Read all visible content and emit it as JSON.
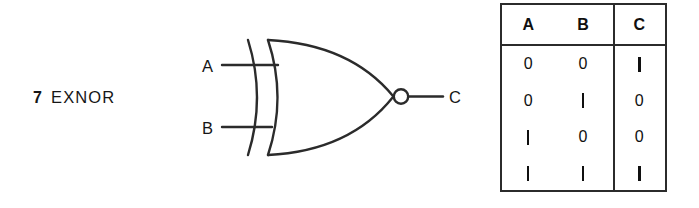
{
  "caption": {
    "index": "7",
    "name": "EXNOR"
  },
  "diagram": {
    "gate_type": "exnor-gate",
    "input_a_label": "A",
    "input_b_label": "B",
    "output_label": "C",
    "has_inversion_bubble": true,
    "line_color": "#2b2b2b"
  },
  "truth_table": {
    "headers": [
      "A",
      "B",
      "C"
    ],
    "rows": [
      {
        "a": "0",
        "b": "0",
        "c": "1"
      },
      {
        "a": "0",
        "b": "1",
        "c": "0"
      },
      {
        "a": "1",
        "b": "0",
        "c": "0"
      },
      {
        "a": "1",
        "b": "1",
        "c": "1"
      }
    ],
    "border_color": "#2b2b2b"
  }
}
